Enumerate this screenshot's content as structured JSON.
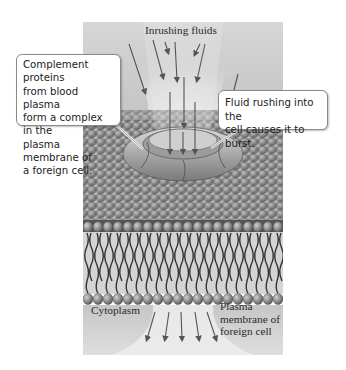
{
  "figure": {
    "palette": {
      "background_light": "#e6e6e6",
      "background_mid": "#bcbcbc",
      "lipid_head": "#8c8c8c",
      "lipid_head_highlight": "#c4c4c4",
      "lipid_tail": "#3c3c3c",
      "pore_ring": "#b0b0b0",
      "arrow": "#555555"
    }
  },
  "labels": {
    "inrushing_fluids": "Inrushing fluids",
    "cytoplasm": "Cytoplasm",
    "plasma_membrane_line1": "Plasma",
    "plasma_membrane_line2": "membrane of",
    "plasma_membrane_line3": "foreign cell"
  },
  "callouts": {
    "left": {
      "line1": "Complement proteins",
      "line2": "from blood plasma",
      "line3": "form a complex in the",
      "line4": "plasma membrane of",
      "line5": "a foreign cell."
    },
    "right": {
      "line1": "Fluid rushing into the",
      "line2": "cell causes it to burst."
    }
  }
}
